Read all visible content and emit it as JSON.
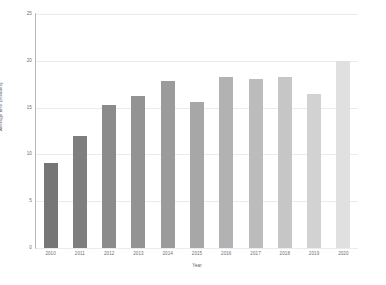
{
  "chart_data": {
    "type": "bar",
    "title": "",
    "xlabel": "Year",
    "ylabel": "Average time (minutes)",
    "categories": [
      "2010",
      "2011",
      "2012",
      "2013",
      "2014",
      "2015",
      "2016",
      "2017",
      "2018",
      "2019",
      "2020"
    ],
    "values": [
      9.1,
      12.0,
      15.3,
      16.2,
      17.8,
      15.6,
      18.3,
      18.1,
      18.3,
      16.5,
      20.0
    ],
    "ylim": [
      0,
      25
    ],
    "yticks": [
      0,
      5,
      10,
      15,
      20,
      25
    ],
    "ytick_labels": [
      "0",
      "5",
      "10",
      "15",
      "20",
      "25"
    ],
    "grid": true,
    "legend": "none",
    "bar_colors": [
      "#767676",
      "#7e7e7e",
      "#8b8b8b",
      "#939393",
      "#9b9b9b",
      "#a7a7a7",
      "#b2b2b2",
      "#bcbcbc",
      "#c6c6c6",
      "#d2d2d2",
      "#e0e0e0"
    ],
    "gridline_color": "#e9ecef",
    "axis_color": "#b6b8ba",
    "background": "#ffffff"
  }
}
